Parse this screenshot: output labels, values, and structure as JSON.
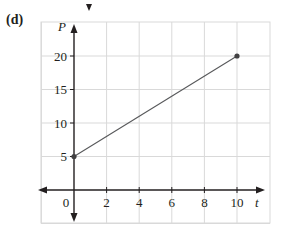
{
  "panel": {
    "label": "(d)"
  },
  "chart_data": {
    "type": "line",
    "title": "",
    "xlabel": "t",
    "ylabel": "P",
    "x": [
      0,
      10
    ],
    "series": [
      {
        "name": "P(t)",
        "values": [
          5,
          20
        ],
        "color": "#58595b"
      }
    ],
    "points": [
      {
        "x": 0,
        "y": 5
      },
      {
        "x": 10,
        "y": 20
      }
    ],
    "xticks": [
      0,
      2,
      4,
      6,
      8,
      10
    ],
    "xtick_labels": [
      "0",
      "2",
      "4",
      "6",
      "8",
      "10"
    ],
    "yticks": [
      5,
      10,
      15,
      20
    ],
    "ytick_labels": [
      "5",
      "10",
      "15",
      "20"
    ],
    "xlim": [
      -2,
      12
    ],
    "ylim": [
      -5,
      25
    ],
    "grid": true,
    "legend": null,
    "colors": {
      "axis": "#231f20",
      "grid": "#d9d9d9",
      "line": "#58595b",
      "point": "#414042"
    }
  }
}
